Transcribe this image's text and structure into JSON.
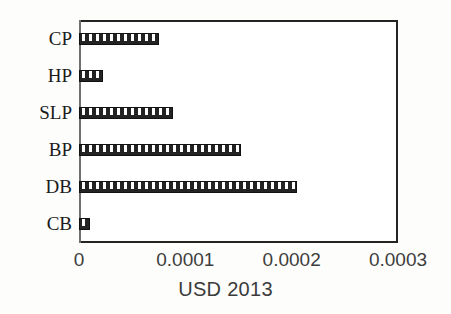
{
  "chart_data": {
    "type": "bar",
    "orientation": "horizontal",
    "title": "",
    "xlabel": "USD 2013",
    "ylabel": "",
    "categories": [
      "CP",
      "HP",
      "SLP",
      "BP",
      "DB",
      "CB"
    ],
    "values": [
      7.5e-05,
      2.25e-05,
      8.85e-05,
      0.000152,
      0.000205,
      1e-05
    ],
    "xlim": [
      0,
      0.0003
    ],
    "xticks": [
      0,
      0.0001,
      0.0002,
      0.0003
    ],
    "xtick_labels": [
      "0",
      "0.0001",
      "0.0002",
      "0.0003"
    ],
    "grid": "vertical",
    "legend": null,
    "series": [
      {
        "name": "USD 2013",
        "values": [
          7.5e-05,
          2.25e-05,
          8.85e-05,
          0.000152,
          0.000205,
          1e-05
        ]
      }
    ],
    "bar_fill": "black-with-white-dot-pattern",
    "colors": {
      "bar": "#232323",
      "bar_pattern": "#ffffff",
      "axis": "#242424",
      "gridline": "#d2d2d2",
      "tick_text": "#3d3d3d",
      "category_text": "#1b1b1b",
      "plot_background": "#ffffff"
    }
  },
  "axis": {
    "y_categories": [
      {
        "label": "CP"
      },
      {
        "label": "HP"
      },
      {
        "label": "SLP"
      },
      {
        "label": "BP"
      },
      {
        "label": "DB"
      },
      {
        "label": "CB"
      }
    ],
    "x_ticks": [
      {
        "label": "0",
        "value": 0
      },
      {
        "label": "0.0001",
        "value": 0.0001
      },
      {
        "label": "0.0002",
        "value": 0.0002
      },
      {
        "label": "0.0003",
        "value": 0.0003
      }
    ],
    "x_title": "USD 2013"
  }
}
